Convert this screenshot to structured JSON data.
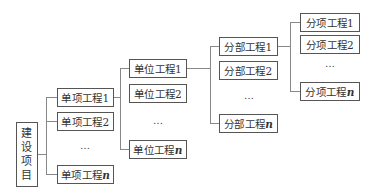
{
  "diagram": {
    "type": "hierarchy-tree",
    "root": {
      "label_chars": [
        "建",
        "设",
        "项",
        "目"
      ],
      "label": "建设项目"
    },
    "levels": [
      {
        "name": "单项工程",
        "items": [
          {
            "prefix": "单项工程",
            "suffix": "1"
          },
          {
            "prefix": "单项工程",
            "suffix": "2"
          },
          {
            "prefix": "单项工程",
            "suffix": "n"
          }
        ],
        "ellipsis": "…"
      },
      {
        "name": "单位工程",
        "items": [
          {
            "prefix": "单位工程",
            "suffix": "1"
          },
          {
            "prefix": "单位工程",
            "suffix": "2"
          },
          {
            "prefix": "单位工程",
            "suffix": "n"
          }
        ],
        "ellipsis": "…"
      },
      {
        "name": "分部工程",
        "items": [
          {
            "prefix": "分部工程",
            "suffix": "1"
          },
          {
            "prefix": "分部工程",
            "suffix": "2"
          },
          {
            "prefix": "分部工程",
            "suffix": "n"
          }
        ],
        "ellipsis": "…"
      },
      {
        "name": "分项工程",
        "items": [
          {
            "prefix": "分项工程",
            "suffix": "1"
          },
          {
            "prefix": "分项工程",
            "suffix": "2"
          },
          {
            "prefix": "分项工程",
            "suffix": "n"
          }
        ],
        "ellipsis": "…"
      }
    ],
    "colors": {
      "border": "#555555",
      "line": "#888888",
      "text": "#333333",
      "background": "#ffffff"
    }
  }
}
